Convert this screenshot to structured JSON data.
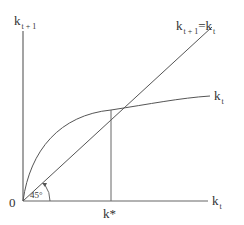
{
  "diagram": {
    "title": "",
    "y_axis_label": {
      "main": "k",
      "sub": "t + 1"
    },
    "x_axis_label": {
      "main": "k",
      "sub": "t"
    },
    "origin_label": "0",
    "steady_state_label": "k*",
    "angle_label": "45°",
    "line_label": {
      "left_main": "k",
      "left_sub": "t + 1",
      "equals": "=",
      "right_main": "k",
      "right_sub": "t"
    },
    "curve_label": {
      "main": "k",
      "sub": "t"
    },
    "colors": {
      "line": "#555555",
      "text": "#333333",
      "background": "#ffffff"
    }
  }
}
